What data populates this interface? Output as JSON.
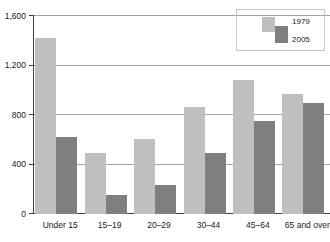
{
  "chart_data": {
    "type": "bar",
    "title": "",
    "subtitle": "",
    "xlabel": "",
    "ylabel": "",
    "categories": [
      "Under 15",
      "15–19",
      "20–29",
      "30–44",
      "45–64",
      "65 and over"
    ],
    "series": [
      {
        "name": "1979",
        "color": "#bfbfbf",
        "values": [
          1420,
          490,
          600,
          865,
          1080,
          965
        ]
      },
      {
        "name": "2005",
        "color": "#7f7f7f",
        "values": [
          620,
          150,
          230,
          490,
          750,
          895
        ]
      }
    ],
    "ylim": [
      0,
      1600
    ],
    "yticks": [
      0,
      400,
      800,
      1200,
      1600
    ],
    "ytick_labels": [
      "0",
      "400",
      "800",
      "1,200",
      "1,600"
    ],
    "grid": true,
    "grid_axis": "y",
    "legend_position": "top-right",
    "legend_entries": [
      {
        "label": "1979",
        "color": "#bfbfbf"
      },
      {
        "label": "2005",
        "color": "#7f7f7f"
      }
    ]
  },
  "colors": {
    "series_1979": "#bfbfbf",
    "series_2005": "#7f7f7f",
    "axis": "#3f3f3f",
    "grid": "#8c8c8c",
    "text": "#1a1a1a",
    "background": "#ffffff"
  }
}
